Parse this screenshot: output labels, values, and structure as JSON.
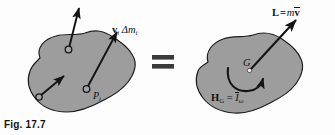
{
  "figure": {
    "caption": "Fig. 17.7",
    "equals_sign": "=",
    "colors": {
      "body_fill": "#9d9d9d",
      "body_stroke": "#1c1c1c",
      "vector_stroke": "#141414",
      "text": "#101010",
      "background": "#fdfdfd",
      "mass_center_dot": "#ffffff"
    }
  },
  "left_body": {
    "name": "rigid-body-particle-momenta",
    "particle_label": {
      "base": "P",
      "subscript": "i"
    },
    "momentum_label": {
      "vector": "v",
      "vector_subscript": "i",
      "delta": "Δ",
      "mass": "m",
      "mass_subscript": "i",
      "full": "vᵢ Δmᵢ"
    },
    "particle_count": 3
  },
  "right_body": {
    "name": "rigid-body-resultant-momenta",
    "mass_center_label": "G",
    "linear_momentum": {
      "symbol": "L",
      "equals": "=",
      "mass": "m",
      "velocity": "v",
      "velocity_has_overbar": true,
      "full": "L = mv̄"
    },
    "angular_momentum": {
      "symbol": "H",
      "subscript": "G",
      "equals": "=",
      "inertia": "I",
      "inertia_has_overbar": true,
      "omega": "ω",
      "full": "H_G = Īω"
    }
  }
}
